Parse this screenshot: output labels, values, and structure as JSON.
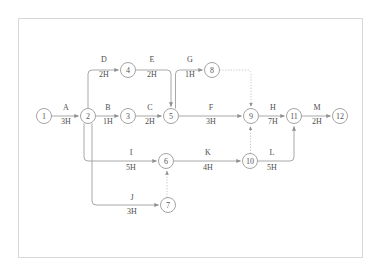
{
  "diagram": {
    "type": "activity-on-arrow-network",
    "title": "",
    "frame": {
      "x": 18,
      "y": 18,
      "width": 345,
      "height": 240,
      "border_color": "#d8d8d8"
    },
    "colors": {
      "background": "#ffffff",
      "node_stroke": "#9a9a9a",
      "node_fill": "#ffffff",
      "edge": "#a8a8a8",
      "dummy_edge": "#bdbdbd",
      "text": "#4e4e4e",
      "arrow": "#8e8e8e"
    },
    "nodes": [
      {
        "id": "1",
        "label": "1",
        "cx": 44,
        "cy": 116,
        "r": 7.5
      },
      {
        "id": "2",
        "label": "2",
        "cx": 88,
        "cy": 116,
        "r": 7.5
      },
      {
        "id": "3",
        "label": "3",
        "cx": 128,
        "cy": 116,
        "r": 7.5
      },
      {
        "id": "4",
        "label": "4",
        "cx": 128,
        "cy": 70,
        "r": 7.5
      },
      {
        "id": "5",
        "label": "5",
        "cx": 171,
        "cy": 116,
        "r": 7.5
      },
      {
        "id": "6",
        "label": "6",
        "cx": 166,
        "cy": 161,
        "r": 7.5
      },
      {
        "id": "7",
        "label": "7",
        "cx": 168,
        "cy": 205,
        "r": 7.5
      },
      {
        "id": "8",
        "label": "8",
        "cx": 212,
        "cy": 70,
        "r": 7.5
      },
      {
        "id": "9",
        "label": "9",
        "cx": 251,
        "cy": 116,
        "r": 7.5
      },
      {
        "id": "10",
        "label": "10",
        "cx": 250,
        "cy": 161,
        "r": 7.5
      },
      {
        "id": "11",
        "label": "11",
        "cx": 294,
        "cy": 116,
        "r": 7.5
      },
      {
        "id": "12",
        "label": "12",
        "cx": 340,
        "cy": 116,
        "r": 7.5
      }
    ],
    "activities": [
      {
        "name": "A",
        "duration": "3H",
        "from": "1",
        "to": "2",
        "label_x": 66,
        "name_y": 110,
        "dur_y": 124
      },
      {
        "name": "B",
        "duration": "1H",
        "from": "2",
        "to": "3",
        "label_x": 108,
        "name_y": 110,
        "dur_y": 124
      },
      {
        "name": "C",
        "duration": "2H",
        "from": "3",
        "to": "5",
        "label_x": 150,
        "name_y": 110,
        "dur_y": 124
      },
      {
        "name": "D",
        "duration": "2H",
        "from": "2",
        "to": "4",
        "label_x": 104,
        "name_y": 62,
        "dur_y": 77
      },
      {
        "name": "E",
        "duration": "2H",
        "from": "4",
        "to": "5",
        "label_x": 152,
        "name_y": 62,
        "dur_y": 77
      },
      {
        "name": "F",
        "duration": "3H",
        "from": "5",
        "to": "9",
        "label_x": 211,
        "name_y": 110,
        "dur_y": 124
      },
      {
        "name": "G",
        "duration": "1H",
        "from": "5",
        "to": "8",
        "label_x": 190,
        "name_y": 62,
        "dur_y": 77
      },
      {
        "name": "H",
        "duration": "7H",
        "from": "9",
        "to": "11",
        "label_x": 273,
        "name_y": 110,
        "dur_y": 124
      },
      {
        "name": "I",
        "duration": "5H",
        "from": "2",
        "to": "6",
        "label_x": 131,
        "name_y": 155,
        "dur_y": 170
      },
      {
        "name": "J",
        "duration": "3H",
        "from": "2",
        "to": "7",
        "label_x": 132,
        "name_y": 200,
        "dur_y": 214
      },
      {
        "name": "K",
        "duration": "4H",
        "from": "6",
        "to": "10",
        "label_x": 208,
        "name_y": 155,
        "dur_y": 170
      },
      {
        "name": "L",
        "duration": "5H",
        "from": "10",
        "to": "11",
        "label_x": 272,
        "name_y": 155,
        "dur_y": 170
      },
      {
        "name": "M",
        "duration": "2H",
        "from": "11",
        "to": "12",
        "label_x": 317,
        "name_y": 110,
        "dur_y": 124
      }
    ],
    "dummy_activities": [
      {
        "from": "8",
        "to": "9",
        "style": "dotted"
      },
      {
        "from": "10",
        "to": "9",
        "style": "dotted"
      },
      {
        "from": "7",
        "to": "6",
        "style": "dotted"
      }
    ]
  }
}
